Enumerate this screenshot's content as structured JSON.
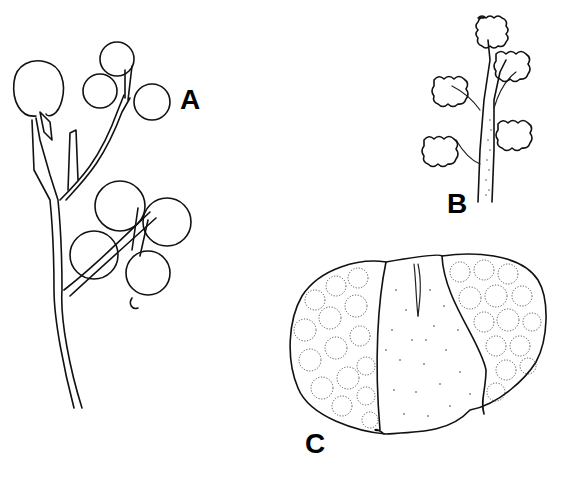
{
  "figure": {
    "panels": [
      {
        "id": "A",
        "label": "A",
        "description": "branching stem bearing rounded winged fruits"
      },
      {
        "id": "B",
        "label": "B",
        "description": "stem bearing fluffy flower heads"
      },
      {
        "id": "C",
        "label": "C",
        "description": "reticulate oval structure with stippled central region"
      }
    ],
    "colors": {
      "ink": "#111111",
      "background": "#ffffff"
    }
  }
}
